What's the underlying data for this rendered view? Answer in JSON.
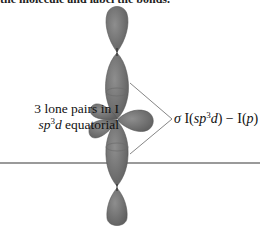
{
  "caption": {
    "top_text": "the molecule and label the bonds."
  },
  "diagram": {
    "lobe_color": "#7a7a7a",
    "lobe_edge_color": "#555555",
    "rule_color": "#9a9a9a",
    "lone_pair_label": {
      "line1": "3 lone pairs in I",
      "line2_italic": "sp",
      "line2_sup": "3",
      "line2_italic2": "d",
      "line2_rest": " equatorial"
    },
    "bond_label": {
      "sigma": "σ",
      "part1": " I(",
      "sp": "sp",
      "sup": "3",
      "d": "d",
      "part2": ") − I(",
      "p": "p",
      "part3": ")"
    }
  }
}
